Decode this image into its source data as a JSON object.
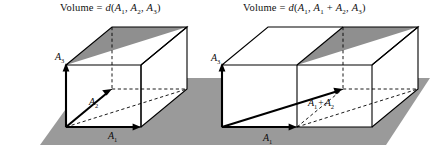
{
  "figure": {
    "title_left": "Volume = d(A1, A2, A3)",
    "title_right": "Volume = d(A1, A1 + A2, A3)",
    "background_color": "#ffffff",
    "plane_fill": "#9a9a9a",
    "shaded_face_fill": "#8f8f8f",
    "line_color": "#000000",
    "panels": [
      {
        "name": "left-parallelepiped",
        "caption": {
          "word": "Volume",
          "equals": "=",
          "fn": "d",
          "open": "(",
          "args": [
            "A1",
            "A2",
            "A3"
          ],
          "close": ")"
        },
        "vectors": [
          {
            "name": "A1",
            "base": "A",
            "sub": "1"
          },
          {
            "name": "A2",
            "base": "A",
            "sub": "2"
          },
          {
            "name": "A3",
            "base": "A",
            "sub": "3"
          }
        ]
      },
      {
        "name": "right-parallelepiped",
        "caption": {
          "word": "Volume",
          "equals": "=",
          "fn": "d",
          "open": "(",
          "args": [
            "A1",
            "A1 + A2",
            "A3"
          ],
          "close": ")"
        },
        "vectors": [
          {
            "name": "A1",
            "base": "A",
            "sub": "1"
          },
          {
            "name": "A1+A2",
            "base": "A",
            "sub": "1",
            "op": "+",
            "base2": "A",
            "sub2": "2"
          },
          {
            "name": "A3",
            "base": "A",
            "sub": "3"
          }
        ]
      }
    ],
    "labels": {
      "volume_word": "Volume",
      "equals_sign": "=",
      "fn_name": "d",
      "paren_open": "(",
      "paren_close": ")",
      "comma": ",",
      "plus": "+",
      "A": "A",
      "one": "1",
      "two": "2",
      "three": "3"
    }
  }
}
